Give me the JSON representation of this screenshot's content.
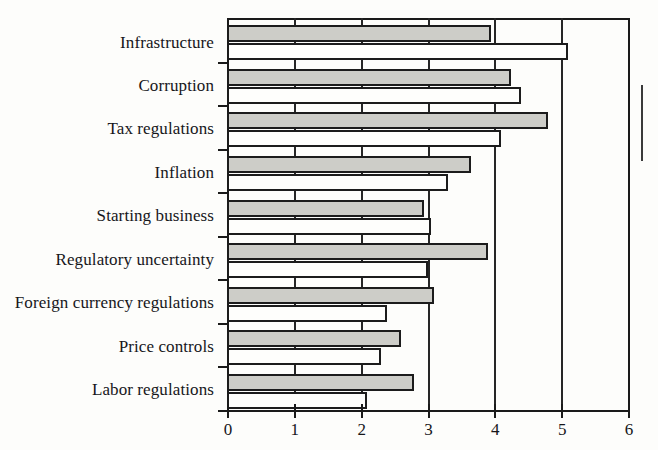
{
  "chart_data": {
    "type": "bar",
    "orientation": "horizontal",
    "title": "",
    "subtitle": "",
    "xlabel": "",
    "ylabel": "",
    "xlim": [
      0,
      6
    ],
    "xticks": [
      0,
      1,
      2,
      3,
      4,
      5,
      6
    ],
    "xtick_labels": [
      "0",
      "1",
      "2",
      "3",
      "4",
      "5",
      "6"
    ],
    "grid": true,
    "grid_axis": "x",
    "legend": false,
    "legend_entries": [],
    "categories": [
      "Infrastructure",
      "Corruption",
      "Tax regulations",
      "Inflation",
      "Starting business",
      "Regulatory uncertainty",
      "Foreign currency regulations",
      "Price controls",
      "Labor regulations"
    ],
    "series": [
      {
        "name": "series-a",
        "fill": "#cdcdc8",
        "values": [
          3.95,
          4.25,
          4.8,
          3.65,
          2.95,
          3.9,
          3.1,
          2.6,
          2.8
        ]
      },
      {
        "name": "series-b",
        "fill": "#fefefc",
        "values": [
          5.1,
          4.4,
          4.1,
          3.3,
          3.05,
          3.0,
          2.4,
          2.3,
          2.1
        ]
      }
    ]
  },
  "colors": {
    "series_a_fill": "#cdcdc8",
    "series_b_fill": "#fefefc",
    "bar_outline": "#1c1c1c",
    "axis": "#1a1a1a",
    "text": "#16161a",
    "background": "#fdfdfb"
  }
}
